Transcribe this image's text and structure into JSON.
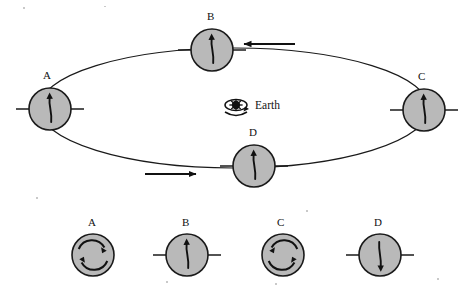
{
  "figure": {
    "background_color": "#ffffff",
    "moon_fill_color": "#b9b9b9",
    "stroke_color": "#1a1a1a"
  },
  "center": {
    "label": "Earth",
    "icon": "earth-rotation-icon",
    "x": 236,
    "y": 105
  },
  "orbit": {
    "shape": "ellipse",
    "center_x": 234,
    "center_y": 108,
    "radius_x": 195,
    "radius_y": 60,
    "direction": "counterclockwise",
    "direction_arrows": [
      {
        "name": "orbit-arrow-top",
        "label": "",
        "points": "left",
        "x": 262,
        "y": 44
      },
      {
        "name": "orbit-arrow-bottom",
        "label": "",
        "points": "right",
        "x": 163,
        "y": 174
      }
    ]
  },
  "orbit_moons": [
    {
      "id": "A",
      "label": "A",
      "cx": 50,
      "cy": 109,
      "r": 21,
      "arrow": "up",
      "axis": "horizontal",
      "label_x": 43,
      "label_y": 79
    },
    {
      "id": "B",
      "label": "B",
      "cx": 212,
      "cy": 50,
      "r": 21,
      "arrow": "up",
      "axis": "horizontal",
      "label_x": 207,
      "label_y": 20
    },
    {
      "id": "C",
      "label": "C",
      "cx": 424,
      "cy": 110,
      "r": 21,
      "arrow": "up",
      "axis": "horizontal",
      "label_x": 418,
      "label_y": 80
    },
    {
      "id": "D",
      "label": "D",
      "cx": 254,
      "cy": 166,
      "r": 21,
      "arrow": "up",
      "axis": "horizontal",
      "label_x": 249,
      "label_y": 136
    }
  ],
  "answer_choices": [
    {
      "id": "A",
      "label": "A",
      "cx": 93,
      "cy": 255,
      "r": 21,
      "type": "rotation-arcs",
      "rotation": "clockwise",
      "axis": "none",
      "label_x": 88,
      "label_y": 226
    },
    {
      "id": "B",
      "label": "B",
      "cx": 187,
      "cy": 255,
      "r": 21,
      "type": "arrow",
      "arrow": "up",
      "axis": "horizontal",
      "label_x": 182,
      "label_y": 226
    },
    {
      "id": "C",
      "label": "C",
      "cx": 283,
      "cy": 255,
      "r": 21,
      "type": "rotation-arcs",
      "rotation": "counterclockwise",
      "axis": "none",
      "label_x": 277,
      "label_y": 226
    },
    {
      "id": "D",
      "label": "D",
      "cx": 380,
      "cy": 255,
      "r": 21,
      "type": "arrow",
      "arrow": "down",
      "axis": "horizontal",
      "label_x": 374,
      "label_y": 226
    }
  ]
}
